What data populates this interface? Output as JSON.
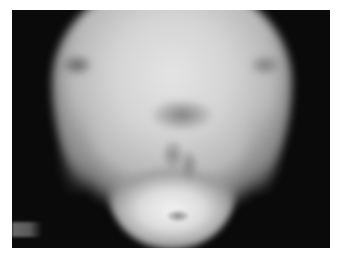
{
  "image": {
    "kind": "radiograph",
    "subject": "skull x-ray (submentovertex-type view)",
    "background_color": "#ffffff",
    "film_color": "#0a0a0a",
    "caption": ""
  }
}
